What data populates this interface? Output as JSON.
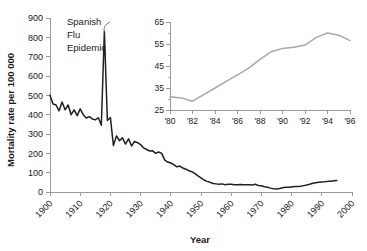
{
  "chart_data": [
    {
      "id": "main",
      "type": "line",
      "title": "",
      "xlabel": "Year",
      "ylabel": "Mortality rate per 100 000",
      "xlim": [
        1900,
        2000
      ],
      "ylim": [
        0,
        900
      ],
      "xticks": [
        1900,
        1910,
        1920,
        1930,
        1940,
        1950,
        1960,
        1970,
        1980,
        1990,
        2000
      ],
      "xticklabels": [
        "1900",
        "1910",
        "1920",
        "1930",
        "1940",
        "1950",
        "1960",
        "1970",
        "1980",
        "1990",
        "2000"
      ],
      "yticks": [
        0,
        100,
        200,
        300,
        400,
        500,
        600,
        700,
        800,
        900
      ],
      "yticklabels": [
        "0",
        "100",
        "200",
        "300",
        "400",
        "500",
        "600",
        "700",
        "800",
        "900"
      ],
      "grid": false,
      "legend": false,
      "line_color": "#231f20",
      "annotations": [
        {
          "text_lines": [
            "Spanish",
            "Flu",
            "Epidemic"
          ],
          "points_to_x": 1918,
          "points_to_y": 830
        }
      ],
      "x": [
        1900,
        1901,
        1902,
        1903,
        1904,
        1905,
        1906,
        1907,
        1908,
        1909,
        1910,
        1911,
        1912,
        1913,
        1914,
        1915,
        1916,
        1917,
        1918,
        1919,
        1920,
        1921,
        1922,
        1923,
        1924,
        1925,
        1926,
        1927,
        1928,
        1929,
        1930,
        1931,
        1932,
        1933,
        1934,
        1935,
        1936,
        1937,
        1938,
        1939,
        1940,
        1941,
        1942,
        1943,
        1944,
        1945,
        1946,
        1947,
        1948,
        1949,
        1950,
        1951,
        1952,
        1953,
        1954,
        1955,
        1956,
        1957,
        1958,
        1959,
        1960,
        1961,
        1962,
        1963,
        1964,
        1965,
        1966,
        1967,
        1968,
        1969,
        1970,
        1971,
        1972,
        1973,
        1974,
        1975,
        1976,
        1977,
        1978,
        1979,
        1980,
        1981,
        1982,
        1983,
        1984,
        1985,
        1986,
        1987,
        1988,
        1989,
        1990,
        1991,
        1992,
        1993,
        1994,
        1995
      ],
      "values": [
        500,
        455,
        450,
        420,
        465,
        425,
        450,
        400,
        425,
        395,
        430,
        400,
        383,
        390,
        378,
        373,
        384,
        345,
        830,
        370,
        385,
        240,
        290,
        265,
        280,
        248,
        275,
        238,
        262,
        255,
        245,
        228,
        220,
        212,
        213,
        200,
        207,
        200,
        165,
        155,
        150,
        142,
        130,
        134,
        124,
        118,
        110,
        105,
        95,
        83,
        73,
        62,
        55,
        50,
        44,
        42,
        40,
        42,
        38,
        40,
        40,
        38,
        38,
        39,
        38,
        38,
        38,
        36,
        40,
        34,
        32,
        27,
        25,
        20,
        17,
        15,
        18,
        22,
        24,
        24,
        26,
        28,
        28,
        30,
        33,
        36,
        40,
        45,
        48,
        50,
        52,
        53,
        55,
        56,
        58,
        60
      ]
    },
    {
      "id": "inset",
      "type": "line",
      "title": "",
      "xlabel": "",
      "ylabel": "",
      "xlim": [
        1980,
        1996
      ],
      "ylim": [
        25,
        65
      ],
      "xticks": [
        1980,
        1982,
        1984,
        1986,
        1988,
        1990,
        1992,
        1994,
        1996
      ],
      "xticklabels": [
        "'80",
        "'82",
        "'84",
        "'86",
        "'88",
        "'90",
        "'92",
        "'94",
        "'96"
      ],
      "yticks": [
        25,
        35,
        45,
        55,
        65
      ],
      "yticklabels": [
        "25",
        "35",
        "45",
        "55",
        "65"
      ],
      "grid": false,
      "legend": false,
      "line_color": "#a8a8a8",
      "x": [
        1980,
        1981,
        1982,
        1983,
        1984,
        1985,
        1986,
        1987,
        1988,
        1989,
        1990,
        1991,
        1992,
        1993,
        1994,
        1995,
        1996
      ],
      "values": [
        31,
        30.5,
        29,
        32,
        35,
        38,
        41,
        44,
        48,
        51.5,
        53,
        53.5,
        54.5,
        58,
        60,
        59,
        56.5
      ]
    }
  ]
}
